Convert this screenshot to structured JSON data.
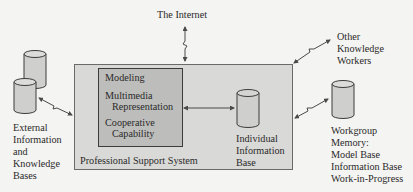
{
  "diagram": {
    "type": "system-architecture",
    "nodes": {
      "internet": {
        "label": "The Internet"
      },
      "other_workers": {
        "lines": [
          "Other",
          "Knowledge",
          "Workers"
        ]
      },
      "external_bases": {
        "lines": [
          "External",
          "Information",
          "and",
          "Knowledge",
          "Bases"
        ]
      },
      "professional_support_system": {
        "label": "Professional Support System"
      },
      "capabilities": {
        "modeling": "Modeling",
        "multimedia_line1": "Multimedia",
        "multimedia_line2": "Representation",
        "cooperative_line1": "Cooperative",
        "cooperative_line2": "Capability"
      },
      "individual_base": {
        "lines": [
          "Individual",
          "Information",
          "Base"
        ]
      },
      "workgroup_memory": {
        "lines": [
          "Workgroup",
          "Memory:",
          "Model Base",
          "Information Base",
          "Work-in-Progress"
        ]
      }
    },
    "edges": [
      {
        "from": "internet",
        "to": "professional_support_system",
        "style": "zigzag-bidirectional"
      },
      {
        "from": "other_workers",
        "to": "professional_support_system",
        "style": "zigzag-bidirectional"
      },
      {
        "from": "external_bases",
        "to": "professional_support_system",
        "style": "zigzag-bidirectional"
      },
      {
        "from": "capabilities",
        "to": "individual_base",
        "style": "bidirectional"
      },
      {
        "from": "workgroup_memory",
        "to": "professional_support_system",
        "style": "zigzag-bidirectional"
      }
    ],
    "colors": {
      "background": "#f4f4f2",
      "outer_box": "#d9d9d7",
      "inner_box": "#bdbdbb",
      "cylinder": "#cfcfcd",
      "stroke": "#3c3c3c",
      "arrow": "#4a4a4a"
    }
  }
}
